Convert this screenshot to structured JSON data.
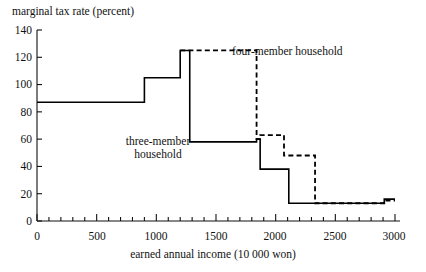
{
  "chart_data": {
    "type": "line",
    "subtype": "step-post",
    "title": "",
    "xlabel": "earned annual income (10 000 won)",
    "ylabel": "marginal tax rate (percent)",
    "xlim": [
      0,
      3000
    ],
    "ylim": [
      0,
      140
    ],
    "xticks": [
      0,
      500,
      1000,
      1500,
      2000,
      2500,
      3000
    ],
    "xtick_labels": [
      "0",
      "500",
      "1000",
      "1500",
      "2000",
      "2500",
      "3000"
    ],
    "xminor_tick_interval": 100,
    "yticks": [
      0,
      20,
      40,
      60,
      80,
      100,
      120,
      140
    ],
    "ytick_labels": [
      "0",
      "20",
      "40",
      "60",
      "80",
      "100",
      "120",
      "140"
    ],
    "grid": false,
    "legend_position": "inline-annotations",
    "series": [
      {
        "name": "three-member household",
        "style": "solid",
        "color": "#000000",
        "x": [
          0,
          900,
          1200,
          1280,
          1840,
          1870,
          2110,
          2720,
          2910,
          3000
        ],
        "y": [
          87,
          105,
          125,
          58,
          60,
          38,
          13,
          13,
          16,
          16
        ]
      },
      {
        "name": "four-member household",
        "style": "dashed",
        "color": "#000000",
        "x": [
          1200,
          1590,
          1840,
          1870,
          2070,
          2330,
          2720,
          2910,
          3000
        ],
        "y": [
          125,
          125,
          60,
          63,
          48,
          13,
          13,
          15,
          15
        ]
      }
    ],
    "annotations": [
      {
        "text_line1": "three-member",
        "text_line2": "household",
        "series": "three-member household"
      },
      {
        "text_line1": "four-member household",
        "text_line2": "",
        "series": "four-member household"
      }
    ]
  },
  "axes": {
    "ylabel": "marginal tax rate (percent)",
    "xlabel": "earned annual income (10 000 won)",
    "ytick_labels": [
      "140",
      "120",
      "100",
      "80",
      "60",
      "40",
      "20",
      "0"
    ],
    "xtick_labels": [
      "0",
      "500",
      "1000",
      "1500",
      "2000",
      "2500",
      "3000"
    ]
  },
  "annotations": {
    "three_member_line1": "three-member",
    "three_member_line2": "household",
    "four_member": "four-member household"
  }
}
